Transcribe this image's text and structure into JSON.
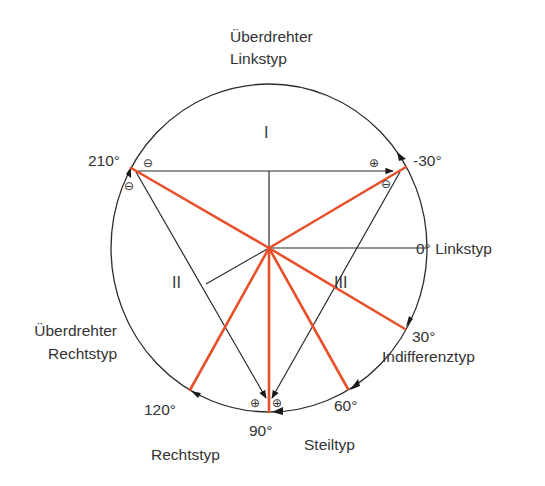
{
  "diagram": {
    "colors": {
      "circle": "#2b2b2b",
      "axis_lines": "#2b2b2b",
      "vectors": "#e8502a",
      "text": "#333333"
    },
    "labels": {
      "top_line1": "Überdrehter",
      "top_line2": "Linkstyp",
      "left_line1": "Überdrehter",
      "left_line2": "Rechtstyp",
      "linkstyp": "0° Linkstyp",
      "indifferenztyp": "Indifferenztyp",
      "steiltyp": "Steiltyp",
      "rechtstyp": "Rechtstyp"
    },
    "angles": {
      "a210": "210°",
      "aminus30": "-30°",
      "a30": "30°",
      "a60": "60°",
      "a90": "90°",
      "a120": "120°"
    },
    "leads": {
      "I": "I",
      "II": "II",
      "III": "III"
    },
    "polarity": {
      "minus": "⊖",
      "plus": "⊕"
    },
    "vectors": [
      {
        "angle": "210°",
        "to": [
          131,
          168
        ]
      },
      {
        "angle": "-30°",
        "to": [
          406,
          167
        ]
      },
      {
        "angle": "30°",
        "to": [
          405,
          329
        ]
      },
      {
        "angle": "60°",
        "to": [
          348,
          389
        ]
      },
      {
        "angle": "90°",
        "to": [
          269,
          412
        ]
      },
      {
        "angle": "120°",
        "to": [
          190,
          390
        ]
      }
    ]
  }
}
